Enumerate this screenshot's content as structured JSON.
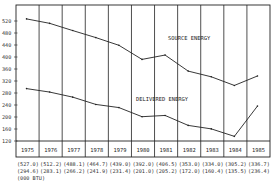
{
  "chart_data": {
    "type": "line",
    "title": "",
    "xlabel": "",
    "ylabel": "",
    "unit_note": "(000 BTU)",
    "ylim": [
      120,
      540
    ],
    "yticks": [
      120,
      160,
      200,
      240,
      280,
      320,
      360,
      400,
      440,
      480,
      520
    ],
    "categories": [
      "1975",
      "1976",
      "1977",
      "1978",
      "1979",
      "1980",
      "1981",
      "1982",
      "1983",
      "1984",
      "1985"
    ],
    "grid": "vertical lines between years",
    "legend": "inline labels",
    "series": [
      {
        "name": "SOURCE ENERGY",
        "values": [
          527.0,
          512.2,
          488.1,
          464.7,
          439.0,
          392.0,
          406.5,
          353.0,
          334.0,
          305.2,
          336.7
        ],
        "labels": [
          "(527.0)",
          "(512.2)",
          "(488.1)",
          "(464.7)",
          "(439.0)",
          "(392.0)",
          "(406.5)",
          "(353.0)",
          "(334.0)",
          "(305.2)",
          "(336.7)"
        ]
      },
      {
        "name": "DELIVERED ENERGY",
        "values": [
          294.6,
          283.1,
          266.2,
          241.9,
          231.4,
          201.0,
          205.2,
          172.0,
          160.4,
          135.5,
          236.4
        ],
        "labels": [
          "(294.6)",
          "(283.1)",
          "(266.2)",
          "(241.9)",
          "(231.4)",
          "(201.0)",
          "(205.2)",
          "(172.0)",
          "(160.4)",
          "(135.5)",
          "(236.4)"
        ]
      }
    ]
  },
  "labels": {
    "source": "SOURCE ENERGY",
    "delivered": "DELIVERED ENERGY",
    "unit": "(000 BTU)"
  }
}
